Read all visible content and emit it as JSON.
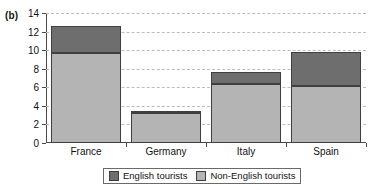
{
  "panel": {
    "label": "(b)"
  },
  "chart_data": {
    "type": "bar",
    "subtype": "stacked",
    "title": "",
    "xlabel": "",
    "ylabel": "",
    "ylim": [
      0,
      14
    ],
    "ytick_step": 2,
    "yticks": [
      "0",
      "2",
      "4",
      "6",
      "8",
      "10",
      "12",
      "14"
    ],
    "grid": true,
    "grid_axis": "y",
    "legend_position": "bottom",
    "categories": [
      "France",
      "Germany",
      "Italy",
      "Spain"
    ],
    "series": [
      {
        "name": "Non-English tourists",
        "color": "#b4b4b4",
        "values": [
          9.7,
          3.2,
          6.4,
          6.1
        ]
      },
      {
        "name": "English tourists",
        "color": "#6e6e6e",
        "values": [
          2.9,
          0.1,
          1.2,
          3.7
        ]
      }
    ],
    "totals": [
      12.6,
      3.3,
      7.6,
      9.8
    ]
  },
  "colors": {
    "english": "#6e6e6e",
    "non_english": "#b4b4b4",
    "axis": "#4a4a4a",
    "grid": "#bdbdbd",
    "background": "#ffffff"
  }
}
